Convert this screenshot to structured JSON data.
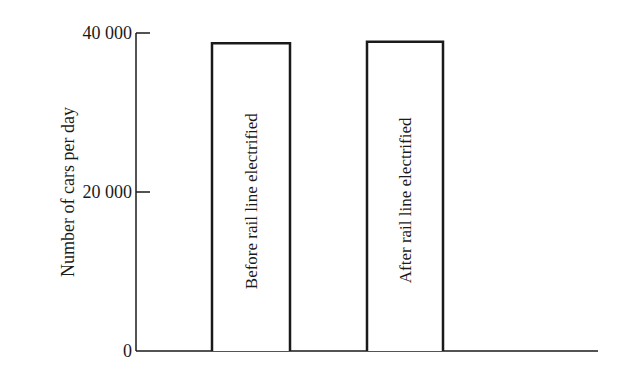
{
  "chart_data": {
    "type": "bar",
    "title": "",
    "xlabel": "",
    "ylabel": "Number of cars per day",
    "ylim": [
      0,
      40000
    ],
    "yticks": [
      0,
      20000,
      40000
    ],
    "ytick_labels": [
      "0",
      "20 000",
      "40 000"
    ],
    "categories": [
      "Before rail line electrified",
      "After rail line electrified"
    ],
    "values": [
      38700,
      38900
    ],
    "bar_labels_inside_rotated": true,
    "grid": false,
    "legend": null,
    "colors": {
      "bar_fill": "#ffffff",
      "bar_stroke": "#1a1a1a",
      "axis": "#1a1a1a"
    }
  }
}
